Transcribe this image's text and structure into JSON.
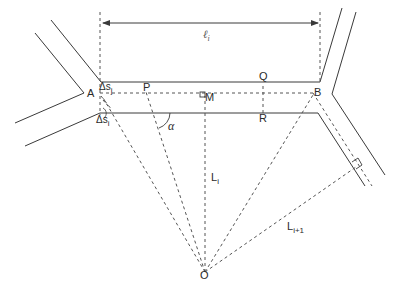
{
  "figure": {
    "type": "geometric road-segment diagram",
    "colors": {
      "line": "#3a3a3a",
      "dash": "#555555",
      "background": "#ffffff"
    }
  },
  "labels": {
    "A": "A",
    "B": "B",
    "P": "P",
    "Q": "Q",
    "R": "R",
    "M": "M",
    "O": "O",
    "alpha": "α",
    "ell_i_base": "ℓ",
    "ell_i_sub": "i",
    "delta_s_j_base": "Δs",
    "delta_s_j_sub": "j",
    "delta_s_i_base": "Δs",
    "delta_s_i_sub": "i",
    "L_i_base": "L",
    "L_i_sub": "i",
    "L_i1_base": "L",
    "L_i1_sub": "i+1"
  }
}
